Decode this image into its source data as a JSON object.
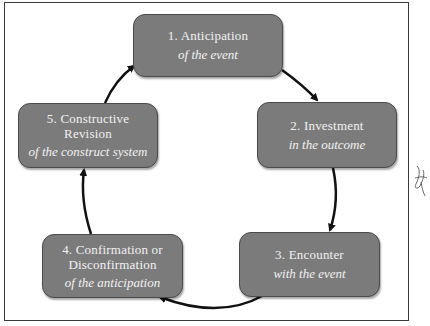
{
  "diagram": {
    "type": "cycle",
    "fill_color": "#7b7b7b",
    "text_color": "#f2f2f2",
    "arrow_color": "#111111",
    "nodes": [
      {
        "title": "1.  Anticipation",
        "subtitle": "of the event"
      },
      {
        "title": "2.  Investment",
        "subtitle": "in the outcome"
      },
      {
        "title": "3. Encounter",
        "subtitle": "with the event"
      },
      {
        "title_line1": "4. Confirmation or",
        "title_line2": "Disconfirmation",
        "subtitle": "of the anticipation"
      },
      {
        "title_line1": "5.  Constructive",
        "title_line2": "Revision",
        "subtitle": "of the construct  system"
      }
    ],
    "edges": [
      {
        "from": 1,
        "to": 2
      },
      {
        "from": 2,
        "to": 3
      },
      {
        "from": 3,
        "to": 4
      },
      {
        "from": 4,
        "to": 5
      },
      {
        "from": 5,
        "to": 1
      }
    ]
  },
  "annotation": {
    "margin_mark": "handwritten-signature"
  }
}
